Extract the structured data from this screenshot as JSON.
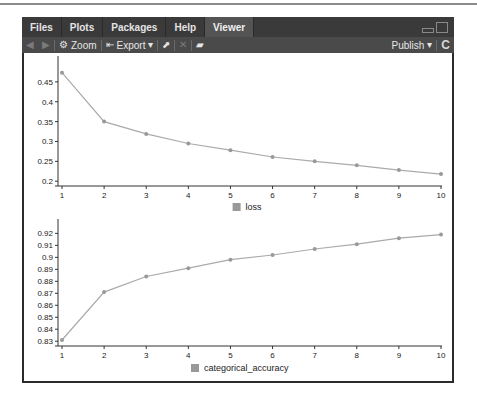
{
  "tabs": [
    {
      "label": "Files",
      "active": false
    },
    {
      "label": "Plots",
      "active": false
    },
    {
      "label": "Packages",
      "active": false
    },
    {
      "label": "Help",
      "active": false
    },
    {
      "label": "Viewer",
      "active": true
    }
  ],
  "toolbar": {
    "back_icon": "◀",
    "forward_icon": "▶",
    "zoom_icon": "⚙",
    "zoom_label": "Zoom",
    "export_icon": "⇤",
    "export_label": "Export",
    "dropdown_caret": "▾",
    "popout_icon": "⬈",
    "clear_icon": "✕",
    "broom_icon": "▰",
    "publish_label": "Publish",
    "refresh_icon": "C"
  },
  "colors": {
    "line": "#aaaaaa",
    "point": "#999999",
    "axis": "#333333",
    "legend_swatch": "#999999"
  },
  "chart_data": [
    {
      "type": "line",
      "title": "",
      "xlabel": "",
      "ylabel": "",
      "x": [
        1,
        2,
        3,
        4,
        5,
        6,
        7,
        8,
        9,
        10
      ],
      "series": [
        {
          "name": "loss",
          "values": [
            0.473,
            0.35,
            0.319,
            0.295,
            0.278,
            0.261,
            0.25,
            0.24,
            0.228,
            0.218
          ]
        }
      ],
      "x_ticks": [
        "1",
        "2",
        "3",
        "4",
        "5",
        "6",
        "7",
        "8",
        "9",
        "10"
      ],
      "y_ticks": [
        "0.2",
        "0.25",
        "0.3",
        "0.35",
        "0.4",
        "0.45"
      ],
      "y_tick_values": [
        0.2,
        0.25,
        0.3,
        0.35,
        0.4,
        0.45
      ],
      "ylim": [
        0.188,
        0.5
      ],
      "legend": {
        "label": "loss",
        "position": "bottom"
      },
      "grid": false
    },
    {
      "type": "line",
      "title": "",
      "xlabel": "",
      "ylabel": "",
      "x": [
        1,
        2,
        3,
        4,
        5,
        6,
        7,
        8,
        9,
        10
      ],
      "series": [
        {
          "name": "categorical_accuracy",
          "values": [
            0.831,
            0.871,
            0.884,
            0.891,
            0.898,
            0.902,
            0.907,
            0.911,
            0.916,
            0.919
          ]
        }
      ],
      "x_ticks": [
        "1",
        "2",
        "3",
        "4",
        "5",
        "6",
        "7",
        "8",
        "9",
        "10"
      ],
      "y_ticks": [
        "0.83",
        "0.84",
        "0.85",
        "0.86",
        "0.87",
        "0.88",
        "0.89",
        "0.9",
        "0.91",
        "0.92"
      ],
      "y_tick_values": [
        0.83,
        0.84,
        0.85,
        0.86,
        0.87,
        0.88,
        0.89,
        0.9,
        0.91,
        0.92
      ],
      "ylim": [
        0.826,
        0.927
      ],
      "legend": {
        "label": "categorical_accuracy",
        "position": "bottom"
      },
      "grid": false
    }
  ]
}
